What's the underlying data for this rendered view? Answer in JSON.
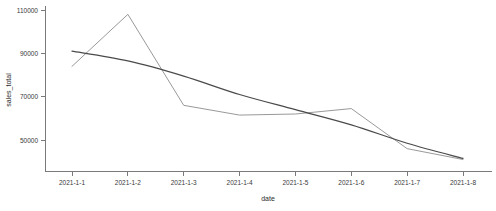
{
  "chart_data": {
    "type": "line",
    "title": "",
    "xlabel": "date",
    "ylabel": "sales_total",
    "categories": [
      "2021-1-1",
      "2021-1-2",
      "2021-1-3",
      "2021-1-4",
      "2021-1-5",
      "2021-1-6",
      "2021-1-7",
      "2021-1-8"
    ],
    "x_tick_labels": [
      "2021-1-1",
      "2021-1-2",
      "2021-1-3",
      "2021-1-4",
      "2021-1-5",
      "2021-1-6",
      "2021-1-7",
      "2021-1-8"
    ],
    "y_tick_labels": [
      "110000",
      "90000",
      "70000",
      "50000"
    ],
    "y_tick_values": [
      110000,
      90000,
      70000,
      50000
    ],
    "ylim": [
      38000,
      112000
    ],
    "grid": false,
    "legend": "none",
    "series": [
      {
        "name": "actual",
        "color": "#8d8d8d",
        "values": [
          84000,
          108000,
          66000,
          61500,
          62000,
          64500,
          46000,
          41000
        ]
      },
      {
        "name": "trend",
        "color": "#4a4a4a",
        "values": [
          91000,
          86500,
          79500,
          71000,
          64000,
          57000,
          48500,
          41500
        ]
      }
    ]
  },
  "axes": {
    "x_title": "date",
    "y_title": "sales_total"
  }
}
